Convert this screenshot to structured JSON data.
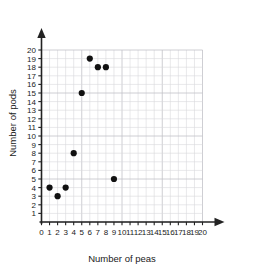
{
  "chart_data": {
    "type": "scatter",
    "title": "",
    "xlabel": "Number of peas",
    "ylabel": "Number of pods",
    "xlim": [
      0,
      20
    ],
    "ylim": [
      0,
      20
    ],
    "grid": true,
    "legend": null,
    "x_ticks": [
      0,
      1,
      2,
      3,
      4,
      5,
      6,
      7,
      8,
      9,
      10,
      11,
      12,
      13,
      14,
      15,
      16,
      17,
      18,
      19,
      20
    ],
    "y_ticks": [
      1,
      2,
      3,
      4,
      5,
      6,
      7,
      8,
      9,
      10,
      11,
      12,
      13,
      14,
      15,
      16,
      17,
      18,
      19,
      20
    ],
    "x_tick_labels": [
      "0",
      "1",
      "2",
      "3",
      "4",
      "5",
      "6",
      "7",
      "8",
      "9",
      "10",
      "11",
      "12",
      "13",
      "14",
      "15",
      "16",
      "17",
      "18",
      "19",
      "20"
    ],
    "y_tick_labels": [
      "1",
      "2",
      "3",
      "4",
      "5",
      "6",
      "7",
      "8",
      "9",
      "10",
      "11",
      "12",
      "13",
      "14",
      "15",
      "16",
      "17",
      "18",
      "19",
      "20"
    ],
    "points": [
      {
        "x": 1,
        "y": 4
      },
      {
        "x": 2,
        "y": 3
      },
      {
        "x": 3,
        "y": 4
      },
      {
        "x": 4,
        "y": 8
      },
      {
        "x": 5,
        "y": 15
      },
      {
        "x": 6,
        "y": 19
      },
      {
        "x": 7,
        "y": 18
      },
      {
        "x": 8,
        "y": 18
      },
      {
        "x": 9,
        "y": 5
      }
    ],
    "marker": {
      "shape": "circle",
      "color": "#111111",
      "radius_px": 3.1
    },
    "colors": {
      "background": "#ffffff",
      "grid_minor": "#d8d8dc",
      "grid_major": "#c2c2c8",
      "axis": "#222222",
      "text": "#1a1a1a"
    }
  }
}
